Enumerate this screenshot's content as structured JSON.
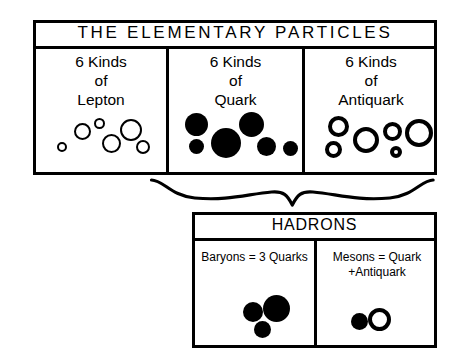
{
  "diagram": {
    "title": "THE ELEMENTARY PARTICLES",
    "elementary_box": {
      "header": "THE ELEMENTARY PARTICLES",
      "columns": [
        {
          "id": "lepton",
          "caption": "6 Kinds\nof\nLepton",
          "count": 6,
          "glyph_style": "hollow-thin",
          "particles": [
            {
              "cx": 62,
              "cy": 147,
              "d": 10
            },
            {
              "cx": 82,
              "cy": 131,
              "d": 17
            },
            {
              "cx": 99,
              "cy": 123,
              "d": 11
            },
            {
              "cx": 111,
              "cy": 143,
              "d": 19
            },
            {
              "cx": 131,
              "cy": 130,
              "d": 22
            },
            {
              "cx": 143,
              "cy": 147,
              "d": 14
            }
          ]
        },
        {
          "id": "quark",
          "caption": "6 Kinds\nof\nQuark",
          "count": 6,
          "glyph_style": "solid",
          "particles": [
            {
              "cx": 196,
              "cy": 124,
              "d": 23
            },
            {
              "cx": 196,
              "cy": 146,
              "d": 15
            },
            {
              "cx": 226,
              "cy": 143,
              "d": 30
            },
            {
              "cx": 251,
              "cy": 124,
              "d": 25
            },
            {
              "cx": 266,
              "cy": 146,
              "d": 19
            },
            {
              "cx": 290,
              "cy": 148,
              "d": 15
            }
          ]
        },
        {
          "id": "antiquark",
          "caption": "6 Kinds\nof\nAntiquark",
          "count": 6,
          "glyph_style": "hollow-thick",
          "particles": [
            {
              "cx": 338,
              "cy": 126,
              "d": 21
            },
            {
              "cx": 333,
              "cy": 149,
              "d": 17
            },
            {
              "cx": 366,
              "cy": 140,
              "d": 26
            },
            {
              "cx": 392,
              "cy": 131,
              "d": 19
            },
            {
              "cx": 396,
              "cy": 152,
              "d": 12
            },
            {
              "cx": 419,
              "cy": 133,
              "d": 28
            }
          ]
        }
      ]
    },
    "connector": {
      "name": "curly-brace",
      "from": "elementary-particles",
      "to": "hadrons"
    },
    "hadrons_box": {
      "header": "HADRONS",
      "panels": [
        {
          "id": "baryons",
          "caption": "Baryons = 3 Quarks",
          "composition_count": 3,
          "particles": [
            {
              "cx": 253,
              "cy": 312,
              "d": 20,
              "style": "solid"
            },
            {
              "cx": 276,
              "cy": 308,
              "d": 27,
              "style": "solid"
            },
            {
              "cx": 262,
              "cy": 329,
              "d": 17,
              "style": "solid"
            }
          ]
        },
        {
          "id": "mesons",
          "caption": "Mesons = Quark\n+Antiquark",
          "composition_count": 2,
          "particles": [
            {
              "cx": 359,
              "cy": 321,
              "d": 17,
              "style": "solid"
            },
            {
              "cx": 379,
              "cy": 319,
              "d": 23,
              "style": "hollow-thick"
            }
          ]
        }
      ]
    },
    "colors": {
      "ink": "#000000",
      "paper": "#ffffff"
    }
  }
}
